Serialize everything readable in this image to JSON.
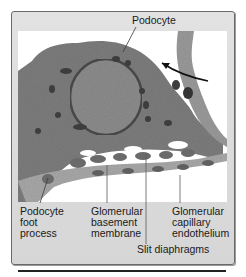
{
  "figure": {
    "labels": {
      "podocyte": "Podocyte",
      "foot_process": [
        "Podocyte",
        "foot",
        "process"
      ],
      "gbm": [
        "Glomerular",
        "basement",
        "membrane"
      ],
      "endothelium": [
        "Glomerular",
        "capillary",
        "endothelium"
      ],
      "slit": "Slit diaphragms"
    },
    "colors": {
      "frame": "#dcdcdc",
      "cell": "#7c7c7c",
      "membrane": "#a9a9a9",
      "text": "#1a1a1a"
    }
  }
}
